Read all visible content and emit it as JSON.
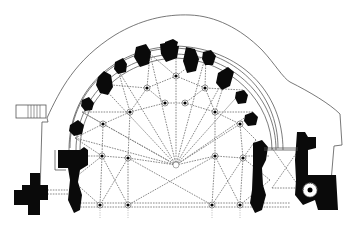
{
  "drawing": {
    "type": "architectural-floor-plan",
    "subject": "apse-chevet-plan",
    "colors": {
      "background": "#ffffff",
      "solid_masonry": "#0a0a0a",
      "rib_lines": "#7a7a7a",
      "outline": "#555555"
    },
    "apse_center": [
      175,
      160
    ],
    "outer_piers": [
      [
        17,
        212
      ],
      [
        72,
        170
      ],
      [
        75,
        138
      ],
      [
        82,
        112
      ],
      [
        100,
        84
      ],
      [
        118,
        70
      ],
      [
        150,
        54
      ],
      [
        176,
        48
      ],
      [
        206,
        54
      ],
      [
        228,
        72
      ],
      [
        243,
        90
      ],
      [
        253,
        112
      ],
      [
        256,
        140
      ]
    ],
    "inner_nodes": [
      [
        100,
        205
      ],
      [
        128,
        205
      ],
      [
        212,
        205
      ],
      [
        240,
        205
      ],
      [
        102,
        156
      ],
      [
        128,
        158
      ],
      [
        215,
        156
      ],
      [
        243,
        158
      ],
      [
        103,
        124
      ],
      [
        130,
        112
      ],
      [
        165,
        103
      ],
      [
        185,
        103
      ],
      [
        215,
        112
      ],
      [
        240,
        124
      ],
      [
        147,
        88
      ],
      [
        176,
        76
      ],
      [
        205,
        88
      ]
    ],
    "keystone": [
      176,
      165
    ]
  }
}
